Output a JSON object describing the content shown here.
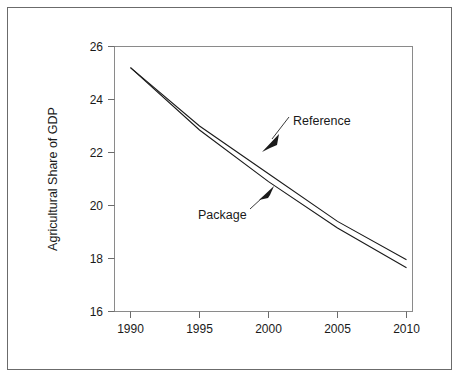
{
  "chart_data": {
    "type": "line",
    "title": "",
    "subtitle": "",
    "xlabel": "",
    "ylabel": "Agricultural Share of GDP",
    "xlim": [
      1990,
      2010
    ],
    "ylim": [
      16,
      26
    ],
    "xticks": [
      1990,
      1995,
      2000,
      2005,
      2010
    ],
    "yticks": [
      16,
      18,
      20,
      22,
      24,
      26
    ],
    "grid": false,
    "legend_position": "inline-annotations",
    "x": [
      1990,
      1995,
      2000,
      2005,
      2010
    ],
    "series": [
      {
        "name": "Reference",
        "color": "#1a1a1a",
        "values": [
          25.2,
          23.0,
          21.2,
          19.4,
          17.95
        ]
      },
      {
        "name": "Package",
        "color": "#1a1a1a",
        "values": [
          25.2,
          22.85,
          20.9,
          19.15,
          17.65
        ]
      }
    ],
    "annotations": [
      {
        "text": "Reference",
        "target_series": "Reference",
        "target_x": 2000.5,
        "target_y": 21.1,
        "arrow": "down-left"
      },
      {
        "text": "Package",
        "target_series": "Package",
        "target_x": 2000.6,
        "target_y": 20.75,
        "arrow": "up-right"
      }
    ]
  },
  "axes": {
    "y_tick_labels": [
      "26",
      "24",
      "22",
      "20",
      "18",
      "16"
    ],
    "x_tick_labels": [
      "1990",
      "1995",
      "2000",
      "2005",
      "2010"
    ],
    "y_axis_title": "Agricultural Share of GDP"
  },
  "labels": {
    "reference": "Reference",
    "package": "Package"
  },
  "colors": {
    "line": "#1a1a1a",
    "axis": "#6b6b6b",
    "frame": "#6b6b6b",
    "text": "#1a1a1a",
    "background": "#ffffff"
  }
}
